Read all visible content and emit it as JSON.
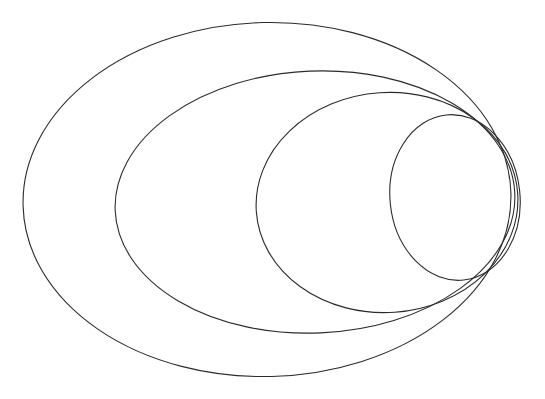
{
  "figure": {
    "background_color": "#ffffff",
    "stroke_color": "#2b2b2b",
    "stroke_width": 1.1,
    "width": 545,
    "height": 399,
    "shape_count": 4,
    "shape_type": "ellipse"
  },
  "chart_data": {
    "type": "scatter",
    "subtitle": "",
    "xlabel": "",
    "ylabel": "",
    "xlim": [
      0,
      545
    ],
    "ylim": [
      0,
      399
    ],
    "grid": false,
    "legend": "none",
    "annotations": [],
    "tick_labels_x": [],
    "tick_labels_y": [],
    "series": [
      {
        "name": "ellipse-1-outermost",
        "cx": 267,
        "cy": 199.5,
        "rx": 244,
        "ry": 177,
        "rotation": -1.5,
        "stroke": "#2b2b2b",
        "fill": "none",
        "left": 23,
        "right": 511,
        "top": 22.5,
        "bottom": 376.5
      },
      {
        "name": "ellipse-2",
        "cx": 315,
        "cy": 202,
        "rx": 200,
        "ry": 131,
        "rotation": -2.5,
        "stroke": "#2b2b2b",
        "fill": "none",
        "left": 115,
        "right": 515,
        "top": 71,
        "bottom": 333
      },
      {
        "name": "ellipse-3",
        "cx": 387,
        "cy": 202.5,
        "rx": 131,
        "ry": 110,
        "rotation": -4,
        "stroke": "#2b2b2b",
        "fill": "none",
        "left": 256,
        "right": 518,
        "top": 92.5,
        "bottom": 312.5
      },
      {
        "name": "ellipse-4-innermost",
        "cx": 455,
        "cy": 197.5,
        "rx": 65,
        "ry": 83,
        "rotation": -6,
        "stroke": "#2b2b2b",
        "fill": "none",
        "left": 390,
        "right": 520,
        "top": 114.5,
        "bottom": 280.5
      }
    ]
  }
}
